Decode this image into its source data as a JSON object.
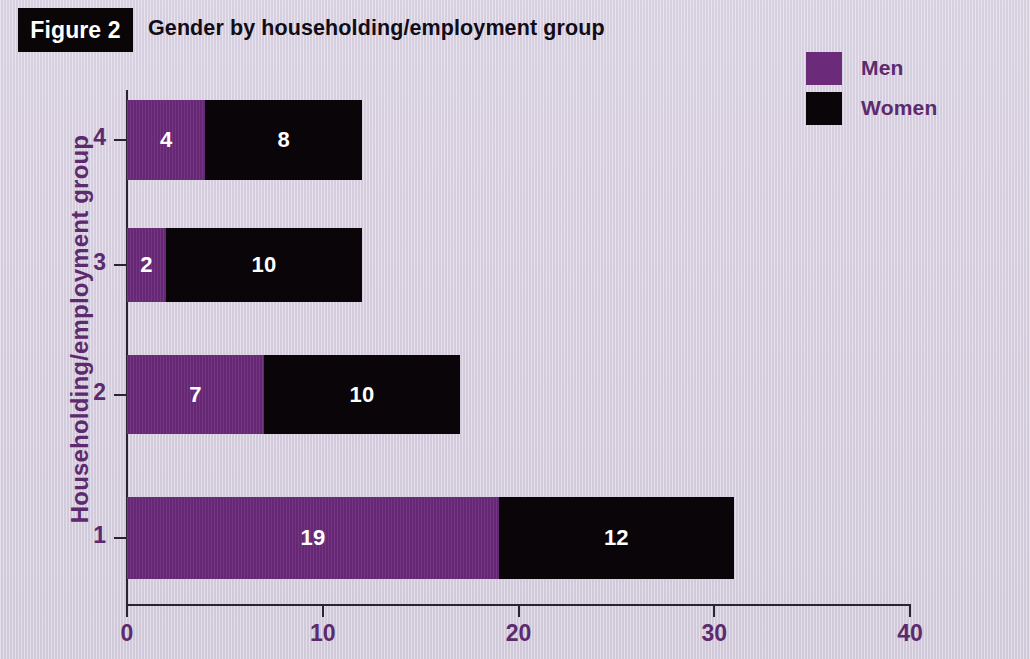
{
  "figure": {
    "badge": "Figure 2",
    "title": "Gender by householding/employment group"
  },
  "legend": {
    "entries": [
      {
        "label": "Men",
        "color": "#6b2a7a"
      },
      {
        "label": "Women",
        "color": "#090508"
      }
    ]
  },
  "axes": {
    "y_title": "Householding/employment group",
    "y_ticks": [
      "4",
      "3",
      "2",
      "1"
    ],
    "x_ticks": [
      "0",
      "10",
      "20",
      "30",
      "40"
    ]
  },
  "chart_data": {
    "type": "bar",
    "title": "Gender by householding/employment group",
    "orientation": "horizontal",
    "stacked": true,
    "xlabel": "",
    "ylabel": "Householding/employment group",
    "categories": [
      "1",
      "2",
      "3",
      "4"
    ],
    "series": [
      {
        "name": "Men",
        "color": "#6b2a7a",
        "values": [
          19,
          7,
          2,
          4
        ]
      },
      {
        "name": "Women",
        "color": "#090508",
        "values": [
          12,
          10,
          10,
          8
        ]
      }
    ],
    "totals": [
      31,
      17,
      12,
      12
    ],
    "xlim": [
      0,
      40
    ],
    "xticks": [
      0,
      10,
      20,
      30,
      40
    ],
    "grid": false,
    "legend_position": "top-right",
    "bars": [
      {
        "category": "4",
        "men": 4,
        "women": 8,
        "total": 12,
        "top": 100,
        "height": 80
      },
      {
        "category": "3",
        "men": 2,
        "women": 10,
        "total": 12,
        "top": 228,
        "height": 74
      },
      {
        "category": "2",
        "men": 7,
        "women": 10,
        "total": 17,
        "top": 355,
        "height": 79
      },
      {
        "category": "1",
        "men": 19,
        "women": 12,
        "total": 31,
        "top": 497,
        "height": 82
      }
    ]
  }
}
